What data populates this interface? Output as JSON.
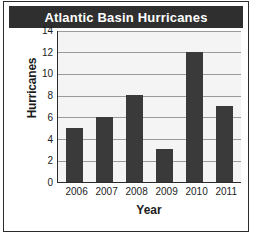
{
  "title": "Atlantic Basin Hurricanes",
  "chart_data": {
    "type": "bar",
    "title": "Atlantic Basin Hurricanes",
    "xlabel": "Year",
    "ylabel": "Hurricanes",
    "categories": [
      "2006",
      "2007",
      "2008",
      "2009",
      "2010",
      "2011"
    ],
    "values": [
      5,
      6,
      8,
      3,
      12,
      7
    ],
    "ylim": [
      0,
      14
    ],
    "yticks": [
      0,
      2,
      4,
      6,
      8,
      10,
      12,
      14
    ],
    "grid": true,
    "legend": null,
    "colors": {
      "bar": "#3a3a3a",
      "plot_background": "#f4f4f4",
      "gridline": "#9a9a9a",
      "axis": "#2b2b2b",
      "title_bar": "#2f2f2f",
      "title_text": "#ffffff",
      "frame": "#2b2b2b"
    }
  }
}
